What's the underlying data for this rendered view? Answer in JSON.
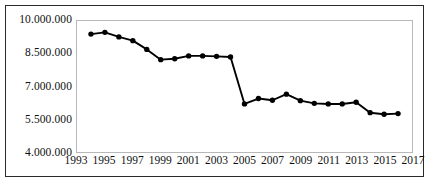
{
  "chart_data": {
    "type": "line",
    "title": "",
    "xlabel": "",
    "ylabel": "",
    "xlim": [
      1993,
      2017
    ],
    "ylim": [
      4000000,
      10000000
    ],
    "grid": false,
    "legend": false,
    "number_format": "european-dot-thousands",
    "marker": "filled-circle",
    "line_color": "#000000",
    "marker_color": "#000000",
    "y_ticks": [
      "10.000.000",
      "8.500.000",
      "7.000.000",
      "5.500.000",
      "4.000.000"
    ],
    "y_tick_values": [
      10000000,
      8500000,
      7000000,
      5500000,
      4000000
    ],
    "x_ticks": [
      "1993",
      "1995",
      "1997",
      "1999",
      "2001",
      "2003",
      "2005",
      "2007",
      "2009",
      "2011",
      "2013",
      "2015",
      "2017"
    ],
    "x_tick_values": [
      1993,
      1995,
      1997,
      1999,
      2001,
      2003,
      2005,
      2007,
      2009,
      2011,
      2013,
      2015,
      2017
    ],
    "x": [
      1994,
      1995,
      1996,
      1997,
      1998,
      1999,
      2000,
      2001,
      2002,
      2003,
      2004,
      2005,
      2006,
      2007,
      2008,
      2009,
      2010,
      2011,
      2012,
      2013,
      2014,
      2015,
      2016
    ],
    "values": [
      9400000,
      9480000,
      9270000,
      9100000,
      8700000,
      8230000,
      8270000,
      8400000,
      8400000,
      8380000,
      8350000,
      6200000,
      6450000,
      6370000,
      6650000,
      6350000,
      6230000,
      6200000,
      6200000,
      6280000,
      5800000,
      5730000,
      5760000
    ],
    "series": [
      {
        "name": "",
        "points": [
          {
            "x": 1994,
            "y": 9400000
          },
          {
            "x": 1995,
            "y": 9480000
          },
          {
            "x": 1996,
            "y": 9270000
          },
          {
            "x": 1997,
            "y": 9100000
          },
          {
            "x": 1998,
            "y": 8700000
          },
          {
            "x": 1999,
            "y": 8230000
          },
          {
            "x": 2000,
            "y": 8270000
          },
          {
            "x": 2001,
            "y": 8400000
          },
          {
            "x": 2002,
            "y": 8400000
          },
          {
            "x": 2003,
            "y": 8380000
          },
          {
            "x": 2004,
            "y": 8350000
          },
          {
            "x": 2005,
            "y": 6200000
          },
          {
            "x": 2006,
            "y": 6450000
          },
          {
            "x": 2007,
            "y": 6370000
          },
          {
            "x": 2008,
            "y": 6650000
          },
          {
            "x": 2009,
            "y": 6350000
          },
          {
            "x": 2010,
            "y": 6230000
          },
          {
            "x": 2011,
            "y": 6200000
          },
          {
            "x": 2012,
            "y": 6200000
          },
          {
            "x": 2013,
            "y": 6280000
          },
          {
            "x": 2014,
            "y": 5800000
          },
          {
            "x": 2015,
            "y": 5730000
          },
          {
            "x": 2016,
            "y": 5760000
          }
        ]
      }
    ]
  }
}
